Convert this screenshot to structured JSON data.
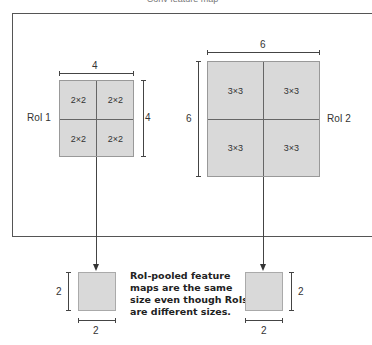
{
  "title": "Conv feature map",
  "roi1": {
    "label": "RoI 1",
    "width_label": "4",
    "height_label": "4",
    "cells": [
      "2×2",
      "2×2",
      "2×2",
      "2×2"
    ]
  },
  "roi2": {
    "label": "RoI 2",
    "width_label": "6",
    "height_label": "6",
    "cells": [
      "3×3",
      "3×3",
      "3×3",
      "3×3"
    ]
  },
  "pooled_left": {
    "width_label": "2",
    "height_label": "2"
  },
  "pooled_right": {
    "width_label": "2",
    "height_label": "2"
  },
  "note": {
    "lines": [
      "RoI-pooled feature",
      "maps are the same",
      "size even though RoIs",
      "are different sizes."
    ]
  },
  "colors": {
    "roi_fill": "#d9d9d9",
    "line": "#444444"
  }
}
